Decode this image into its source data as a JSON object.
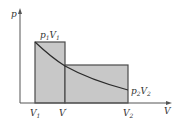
{
  "diagram": {
    "type": "p-V diagram",
    "axes": {
      "y_label": "p",
      "x_label": "V"
    },
    "points": {
      "state1": {
        "label_main": "p",
        "label_sub1": "1",
        "label_v": "V",
        "label_sub2": "1"
      },
      "state2": {
        "label_main": "p",
        "label_sub1": "2",
        "label_v": "V",
        "label_sub2": "2"
      }
    },
    "x_ticks": [
      {
        "main": "V",
        "sub": "1",
        "sup": ""
      },
      {
        "main": "V",
        "sub": "",
        "sup": "′"
      },
      {
        "main": "V",
        "sub": "2",
        "sup": ""
      }
    ],
    "colors": {
      "fill": "#c8c8c8",
      "stroke": "#4a4a4a",
      "axis": "#555555"
    }
  }
}
